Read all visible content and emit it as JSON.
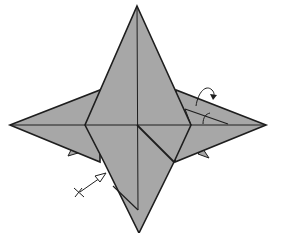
{
  "diagram": {
    "colors": {
      "paper": "#a7a7a7",
      "line": "#1e1e1e",
      "background": "#ffffff"
    },
    "symbols": [
      {
        "name": "fold-behind-arrow",
        "position": "right wing"
      },
      {
        "name": "valley-fold-arrow",
        "position": "lower-left edge"
      }
    ]
  }
}
